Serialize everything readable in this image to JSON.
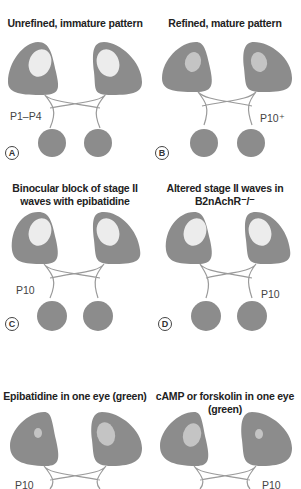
{
  "colors": {
    "eye": "#8c8c8c",
    "spot_light": "#ececec",
    "spot_mid": "#c4c4c4",
    "line": "#9a9a9a",
    "lgn": "#8c8c8c"
  },
  "panels": [
    {
      "letter": "A",
      "title": "Unrefined, immature pattern",
      "age": "P1–P4"
    },
    {
      "letter": "B",
      "title": "Refined, mature pattern",
      "age": "P10⁺"
    },
    {
      "letter": "C",
      "title": "Binocular block of stage II waves with epibatidine",
      "age": "P10"
    },
    {
      "letter": "D",
      "title": "Altered stage II waves in B2nAchR⁻/⁻",
      "age": "P10"
    },
    {
      "letter": "E",
      "title": "Epibatidine in one eye (green)",
      "age": "P10"
    },
    {
      "letter": "F",
      "title": "cAMP or forskolin in one eye (green)",
      "age": "P10"
    }
  ]
}
